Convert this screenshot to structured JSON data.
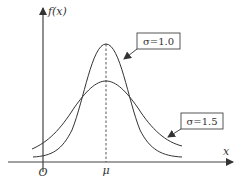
{
  "diagram": {
    "y_axis_label": "f(x)",
    "x_axis_label": "x",
    "origin_label": "O",
    "mean_label": "μ",
    "curves": [
      {
        "name": "narrow",
        "sigma_label": "σ=1.0",
        "sigma": 1.0
      },
      {
        "name": "wide",
        "sigma_label": "σ=1.5",
        "sigma": 1.5
      }
    ],
    "colors": {
      "line": "#333333",
      "background": "#ffffff"
    }
  }
}
